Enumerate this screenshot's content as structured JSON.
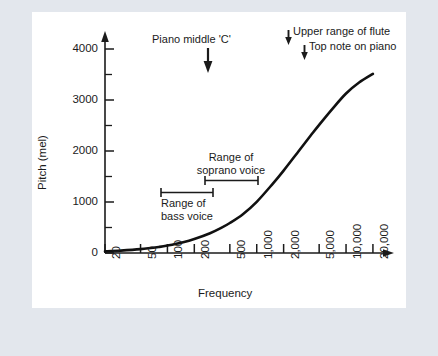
{
  "figure": {
    "background_color": "#e3e7ed",
    "panel_color": "#ffffff",
    "ink_color": "#1b1b1b"
  },
  "chart_data": {
    "type": "line",
    "title": "",
    "xlabel": "Frequency",
    "ylabel": "Pitch  (mel)",
    "xscale": "log",
    "xlim": [
      20,
      24000
    ],
    "ylim": [
      0,
      4200
    ],
    "grid": false,
    "legend": "none",
    "x_tick_labels": [
      "20",
      "50",
      "100",
      "200",
      "500",
      "1,000",
      "2,000",
      "5,000",
      "10,000",
      "20,000"
    ],
    "x_tick_values": [
      20,
      50,
      100,
      200,
      500,
      1000,
      2000,
      5000,
      10000,
      20000
    ],
    "y_tick_labels": [
      "0",
      "1000",
      "2000",
      "3000",
      "4000"
    ],
    "y_tick_values": [
      0,
      1000,
      2000,
      3000,
      4000
    ],
    "y_minor_tick_values": [
      500,
      1500,
      2500,
      3500
    ],
    "series": [
      {
        "name": "mel scale",
        "x": [
          20,
          30,
          50,
          80,
          100,
          150,
          200,
          300,
          400,
          500,
          700,
          1000,
          1500,
          2000,
          3000,
          4000,
          5000,
          7000,
          10000,
          14000,
          20000
        ],
        "y": [
          31,
          46,
          75,
          118,
          145,
          210,
          272,
          386,
          490,
          586,
          758,
          1000,
          1346,
          1610,
          2008,
          2289,
          2504,
          2812,
          3116,
          3330,
          3500
        ]
      }
    ],
    "annotations": [
      {
        "name": "piano-middle-c",
        "text": "Piano middle  'C'",
        "marker": "down-arrow",
        "frequency": 262,
        "lines": [
          "Piano middle  'C'"
        ]
      },
      {
        "name": "upper-range-of-flute",
        "text": "Upper range of flute",
        "marker": "down-arrow-inline",
        "frequency": 2093,
        "lines": [
          "Upper range of flute"
        ]
      },
      {
        "name": "top-note-on-piano",
        "text": "Top note on piano",
        "marker": "down-arrow-inline",
        "frequency": 4186,
        "lines": [
          "Top note on piano"
        ]
      },
      {
        "name": "range-of-soprano-voice",
        "text": "Range of soprano voice",
        "marker": "range-bar",
        "frequency_low": 262,
        "frequency_high": 1047,
        "lines": [
          "Range of",
          "soprano voice"
        ]
      },
      {
        "name": "range-of-bass-voice",
        "text": "Range of bass voice",
        "marker": "range-bar",
        "frequency_low": 82,
        "frequency_high": 330,
        "lines": [
          "Range of",
          "bass voice"
        ]
      }
    ]
  },
  "labels": {
    "x_axis_title": "Frequency",
    "y_axis_title": "Pitch  (mel)",
    "piano_middle_c": "Piano middle  'C'",
    "upper_range_of_flute": "Upper range of flute",
    "top_note_on_piano": "Top note on piano",
    "soprano_line1": "Range of",
    "soprano_line2": "soprano voice",
    "bass_line1": "Range of",
    "bass_line2": "bass voice",
    "ytick_0": "0",
    "ytick_1000": "1000",
    "ytick_2000": "2000",
    "ytick_3000": "3000",
    "ytick_4000": "4000",
    "xtick_20": "20",
    "xtick_50": "50",
    "xtick_100": "100",
    "xtick_200": "200",
    "xtick_500": "500",
    "xtick_1000": "1,000",
    "xtick_2000": "2,000",
    "xtick_5000": "5,000",
    "xtick_10000": "10,000",
    "xtick_20000": "20,000"
  }
}
